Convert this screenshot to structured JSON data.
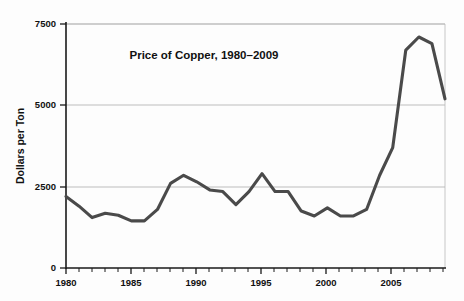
{
  "chart_data": {
    "type": "line",
    "title": "Price of Copper, 1980–2009",
    "xlabel": "",
    "ylabel": "Dollars per Ton",
    "xlim": [
      1980,
      2009
    ],
    "ylim": [
      0,
      7500
    ],
    "grid": true,
    "legend": "none",
    "x_tick_labels": [
      "1980",
      "1985",
      "1990",
      "1995",
      "2000",
      "2005"
    ],
    "x_tick_values": [
      1980,
      1985,
      1990,
      1995,
      2000,
      2005
    ],
    "x_minor_tick_step": 1,
    "y_tick_labels": [
      "0",
      "2500",
      "5000",
      "7500"
    ],
    "y_tick_values": [
      0,
      2500,
      5000,
      7500
    ],
    "series": [
      {
        "name": "Price of Copper",
        "color": "#4a4a4a",
        "x": [
          1980,
          1981,
          1982,
          1983,
          1984,
          1985,
          1986,
          1987,
          1988,
          1989,
          1990,
          1991,
          1992,
          1993,
          1994,
          1995,
          1996,
          1997,
          1998,
          1999,
          2000,
          2001,
          2002,
          2003,
          2004,
          2005,
          2006,
          2007,
          2008,
          2009
        ],
        "values": [
          2200,
          1900,
          1550,
          1680,
          1620,
          1450,
          1450,
          1800,
          2600,
          2850,
          2650,
          2400,
          2350,
          1950,
          2350,
          2900,
          2350,
          2350,
          1750,
          1600,
          1850,
          1600,
          1600,
          1800,
          2850,
          3700,
          6700,
          7100,
          6900,
          5200
        ]
      }
    ]
  },
  "annotations": {
    "title_x_fraction": 0.44,
    "title_y_value": 6600
  }
}
